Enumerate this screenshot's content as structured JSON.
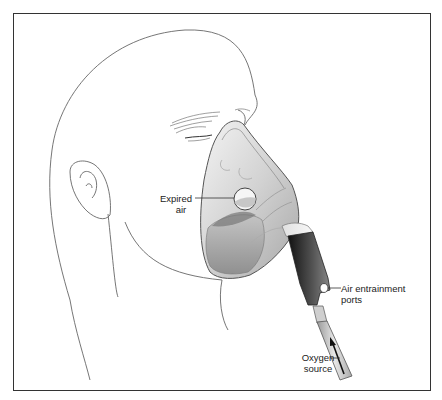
{
  "figure": {
    "labels": {
      "expired_air": [
        "Expired",
        "air"
      ],
      "air_entrainment": [
        "Air entrainment",
        "ports"
      ],
      "oxygen_source": [
        "Oxygen",
        "source"
      ]
    },
    "caption_visible": "Figure (caption cut off)",
    "colors": {
      "frame": "#333333",
      "line": "#555555",
      "mask_shade": "#b8b8b8",
      "tube_dark": "#2a2a2a",
      "label_text": "#222222"
    }
  }
}
